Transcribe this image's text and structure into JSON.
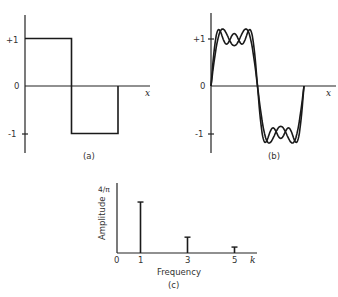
{
  "chart_data": [
    {
      "id": "a",
      "type": "line",
      "caption": "(a)",
      "description": "Square wave",
      "xlabel": "x",
      "ylabel": "",
      "yticks": [
        "+1",
        "0",
        "-1"
      ],
      "ylim": [
        -1,
        1
      ],
      "series": [
        {
          "name": "square-wave",
          "x": [
            0,
            0,
            1,
            1,
            2,
            2
          ],
          "y": [
            1,
            1,
            1,
            -1,
            -1,
            0
          ]
        }
      ],
      "grid": false
    },
    {
      "id": "b",
      "type": "line",
      "caption": "(b)",
      "description": "Fourier partial-sum approximations of the square wave",
      "xlabel": "x",
      "ylabel": "",
      "yticks": [
        "+1",
        "0",
        "-1"
      ],
      "ylim": [
        -1,
        1
      ],
      "series": [
        {
          "name": "sum-k1-k3",
          "harmonics": [
            1,
            3
          ],
          "amplitudes": [
            "4/π",
            "4/(3π)"
          ]
        },
        {
          "name": "sum-k1-k3-k5",
          "harmonics": [
            1,
            3,
            5
          ],
          "amplitudes": [
            "4/π",
            "4/(3π)",
            "4/(5π)"
          ]
        }
      ],
      "grid": false
    },
    {
      "id": "c",
      "type": "bar",
      "caption": "(c)",
      "description": "Amplitude spectrum",
      "xlabel": "Frequency",
      "ylabel": "Amplitude",
      "x_axis_symbol": "k",
      "ytick_label": "4/π",
      "xticks": [
        "0",
        "1",
        "3",
        "5"
      ],
      "categories": [
        1,
        3,
        5
      ],
      "values": [
        1.03,
        0.32,
        0.12
      ],
      "ylim": [
        0,
        1.273
      ],
      "grid": false
    }
  ]
}
